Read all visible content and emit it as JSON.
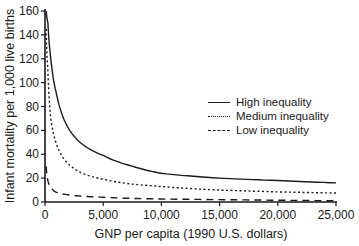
{
  "chart_data": {
    "type": "line",
    "title": "",
    "xlabel": "GNP per capita (1990 U.S. dollars)",
    "ylabel": "Infant mortality per 1,000 live births",
    "xlim": [
      0,
      25000
    ],
    "ylim": [
      0,
      160
    ],
    "x_ticks": [
      0,
      5000,
      10000,
      15000,
      20000,
      25000
    ],
    "x_tick_labels": [
      "0",
      "5,000",
      "10,000",
      "15,000",
      "20,000",
      "25,000"
    ],
    "y_ticks": [
      0,
      20,
      40,
      60,
      80,
      100,
      120,
      140,
      160
    ],
    "y_tick_labels": [
      "0",
      "20",
      "40",
      "60",
      "80",
      "100",
      "120",
      "140",
      "160"
    ],
    "grid": false,
    "legend_position": "upper right",
    "x": [
      100,
      250,
      500,
      1000,
      2000,
      3000,
      5000,
      7500,
      10000,
      15000,
      20000,
      25000
    ],
    "series": [
      {
        "name": "High inequality",
        "style": "solid",
        "values": [
          160,
          150,
          120,
          90,
          62,
          50,
          39,
          30,
          24,
          20,
          18,
          16
        ]
      },
      {
        "name": "Medium inequality",
        "style": "dotted",
        "values": [
          145,
          110,
          70,
          48,
          32,
          25,
          19,
          15,
          13,
          10,
          8.5,
          7.5
        ]
      },
      {
        "name": "Low inequality",
        "style": "dashed",
        "values": [
          30,
          18,
          12,
          8,
          6,
          5,
          4,
          3,
          2.5,
          2,
          1.5,
          1
        ]
      }
    ]
  },
  "legend": {
    "items": [
      {
        "label": "High inequality",
        "style": "solid"
      },
      {
        "label": "Medium inequality",
        "style": "dotted"
      },
      {
        "label": "Low inequality",
        "style": "dashed"
      }
    ]
  }
}
